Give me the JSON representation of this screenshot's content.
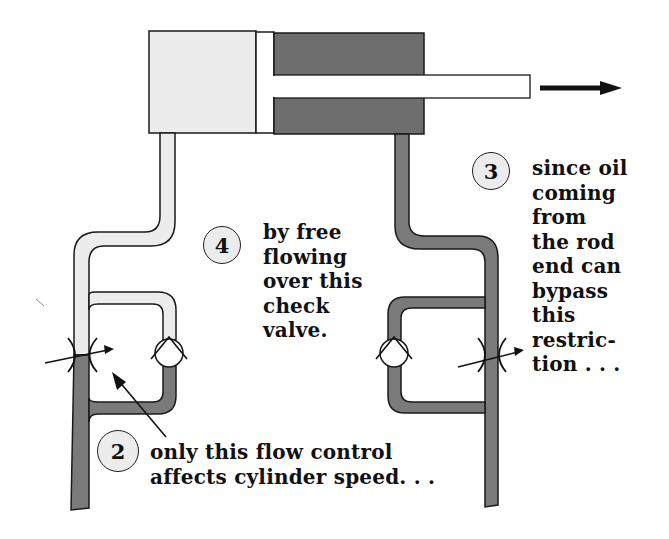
{
  "diagram": {
    "colors": {
      "pressure_oil": "#7a7a7a",
      "low_pressure_oil": "#ececec",
      "outline": "#1a1a1a",
      "piston": "#ffffff",
      "badge_fill": "#ececec"
    },
    "cylinder": {
      "direction_arrow": "right-arrow",
      "cap_end_fill": "low_pressure_oil",
      "rod_end_fill": "pressure_oil"
    },
    "callouts": [
      {
        "number": "2",
        "lines": [
          "only this flow control",
          "affects cylinder speed. . ."
        ]
      },
      {
        "number": "3",
        "lines": [
          "since oil",
          "coming",
          "from",
          "the rod",
          "end can",
          "bypass",
          "this",
          "restric-",
          "tion . . ."
        ]
      },
      {
        "number": "4",
        "lines": [
          "by free",
          "flowing",
          "over this",
          "check",
          "valve."
        ]
      }
    ]
  }
}
